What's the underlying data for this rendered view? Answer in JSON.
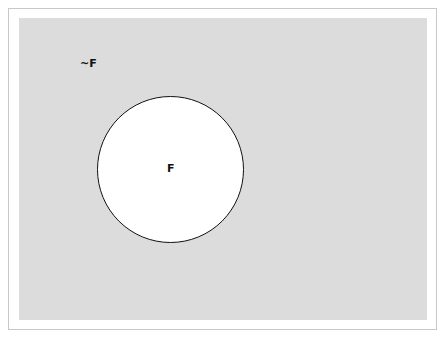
{
  "diagram": {
    "type": "venn",
    "universe": {
      "label": "~F",
      "fill": "#dcdcdc"
    },
    "sets": [
      {
        "label": "F",
        "fill": "#ffffff",
        "stroke": "#111111"
      }
    ]
  }
}
